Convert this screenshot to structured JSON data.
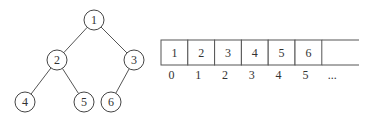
{
  "tree": {
    "nodes": [
      {
        "id": "1",
        "label": "1",
        "x": 94,
        "y": 20
      },
      {
        "id": "2",
        "label": "2",
        "x": 57,
        "y": 60
      },
      {
        "id": "3",
        "label": "3",
        "x": 134,
        "y": 60
      },
      {
        "id": "4",
        "label": "4",
        "x": 25,
        "y": 102
      },
      {
        "id": "5",
        "label": "5",
        "x": 84,
        "y": 102
      },
      {
        "id": "6",
        "label": "6",
        "x": 111,
        "y": 102
      }
    ],
    "edges": [
      [
        "1",
        "2"
      ],
      [
        "1",
        "3"
      ],
      [
        "2",
        "4"
      ],
      [
        "2",
        "5"
      ],
      [
        "3",
        "6"
      ]
    ],
    "radius": 10
  },
  "array": {
    "values": [
      "1",
      "2",
      "3",
      "4",
      "5",
      "6"
    ],
    "indices": [
      "0",
      "1",
      "2",
      "3",
      "4",
      "5",
      "..."
    ],
    "x": 161,
    "y": 40,
    "cell_width": 26.8,
    "cell_height": 25,
    "end_x": 359
  },
  "colors": {
    "stroke": "#555555",
    "text": "#333333",
    "background": "#ffffff"
  }
}
